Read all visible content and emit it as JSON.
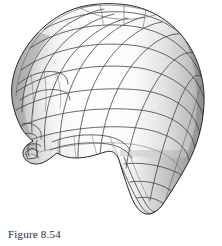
{
  "figure": {
    "caption": "Figure 8.54",
    "render_style": "shaded grayscale surface with black quad-mesh wireframe overlay",
    "background_color": "#ffffff",
    "wireframe_color": "#3a3a3a",
    "silhouette_color": "#262626",
    "highlight_color": "#ffffff",
    "midtone_color": "#cfcfcf",
    "shadow_color": "#8e8e8e",
    "deep_shadow_color": "#6e6e6e",
    "regions": [
      "cranium",
      "forehead",
      "brow",
      "nose",
      "lips",
      "chin",
      "jaw",
      "cheek",
      "neck",
      "back-of-head"
    ]
  },
  "page": {
    "width": 222,
    "height": 246
  }
}
